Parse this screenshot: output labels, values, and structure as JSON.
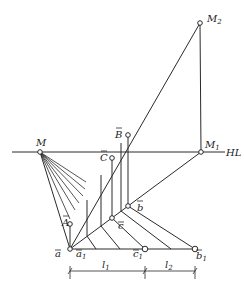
{
  "diagram": {
    "labels": {
      "M2": "M",
      "M2_sub": "2",
      "M1": "M",
      "M1_sub": "1",
      "HL": "HL",
      "M": "M",
      "B": "B",
      "C": "C",
      "A": "A",
      "b": "b",
      "c": "c",
      "a": "a",
      "a1": "a",
      "a1_sub": "1",
      "c1": "c",
      "c1_sub": "1",
      "b1": "b",
      "b1_sub": "1",
      "l1": "l",
      "l1_sub": "1",
      "l2": "l",
      "l2_sub": "2"
    },
    "points": {
      "M2": [
        200,
        23
      ],
      "M1": [
        201,
        152
      ],
      "M": [
        40,
        152
      ],
      "B": [
        128,
        135
      ],
      "C": [
        112,
        158
      ],
      "A": [
        70,
        224
      ],
      "b": [
        128,
        206
      ],
      "c": [
        112,
        218
      ],
      "a": [
        70,
        249
      ],
      "c1": [
        145,
        249
      ],
      "b1": [
        195,
        249
      ]
    },
    "horizon_line": {
      "label": "HL",
      "y": 152,
      "x_start": 12,
      "x_end": 225
    },
    "dimensions": [
      {
        "label": "l1",
        "from": "a1",
        "to": "c1"
      },
      {
        "label": "l2",
        "from": "c1",
        "to": "b1"
      }
    ]
  }
}
